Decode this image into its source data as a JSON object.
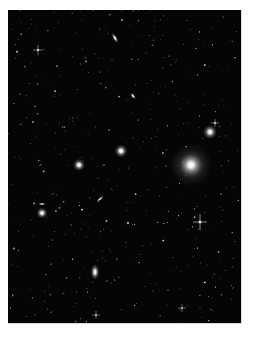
{
  "image": {
    "subject": "galaxy cluster star field",
    "background_color": "#050505",
    "page_color": "#ffffff"
  },
  "objects": [
    {
      "kind": "elliptical-galaxy",
      "name": "giant-elliptical",
      "brightness": 1.0
    },
    {
      "kind": "elliptical-galaxy",
      "name": "upper-right-elliptical",
      "brightness": 0.9
    },
    {
      "kind": "elliptical-galaxy",
      "name": "center-elliptical",
      "brightness": 0.85
    },
    {
      "kind": "elliptical-galaxy",
      "name": "left-elliptical",
      "brightness": 0.8
    },
    {
      "kind": "elliptical-galaxy",
      "name": "lower-left-elliptical",
      "brightness": 0.8
    },
    {
      "kind": "spiral-galaxy-edge-on",
      "name": "top-edge-on-galaxy",
      "brightness": 0.85
    },
    {
      "kind": "spiral-galaxy-edge-on",
      "name": "upper-mid-edge-on-galaxy",
      "brightness": 0.8
    },
    {
      "kind": "spiral-galaxy-edge-on",
      "name": "middle-edge-on-galaxy",
      "brightness": 0.8
    },
    {
      "kind": "spiral-galaxy-edge-on",
      "name": "small-left-edge-on-galaxy",
      "brightness": 0.75
    },
    {
      "kind": "lenticular-galaxy",
      "name": "bottom-lenticular",
      "brightness": 0.95
    },
    {
      "kind": "star",
      "name": "bright-star-right",
      "brightness": 0.95
    },
    {
      "kind": "star",
      "name": "star-near-upper-galaxy",
      "brightness": 0.8
    },
    {
      "kind": "star",
      "name": "star-top-left",
      "brightness": 0.8
    },
    {
      "kind": "star",
      "name": "star-bottom",
      "brightness": 0.8
    },
    {
      "kind": "star",
      "name": "star-bottom-right",
      "brightness": 0.75
    },
    {
      "kind": "star",
      "name": "star-top",
      "brightness": 0.7
    }
  ],
  "field_stars": {
    "count": 420,
    "seed": 7
  }
}
